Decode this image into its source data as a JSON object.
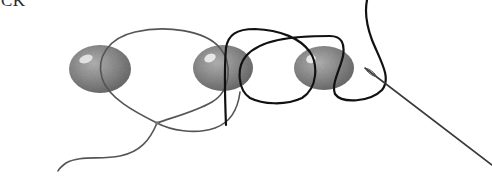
{
  "caption_fragment": "CK",
  "illustration": {
    "description": "Beading diagram: three oval beads strung with a loop of thread, a dark working thread passing through beads 2 and 3, and a needle",
    "beads": [
      {
        "id": "bead-1",
        "cx": 100,
        "cy": 69,
        "rx": 31,
        "ry": 24
      },
      {
        "id": "bead-2",
        "cx": 223,
        "cy": 68,
        "rx": 30,
        "ry": 23
      },
      {
        "id": "bead-3",
        "cx": 324,
        "cy": 68,
        "rx": 30,
        "ry": 22
      }
    ],
    "colors": {
      "bead_fill": "#8c8c8c",
      "bead_dark": "#6a6a6a",
      "bead_highlight": "#e8e8e8",
      "thin_thread": "#555555",
      "dark_thread": "#111111",
      "needle": "#3a3a3a",
      "background": "#ffffff"
    }
  }
}
